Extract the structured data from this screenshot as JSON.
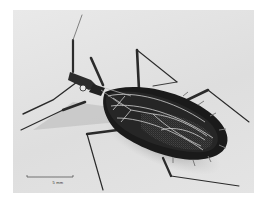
{
  "figure": {
    "scale_bar_label": "5 mm",
    "colors": {
      "background": "#ffffff",
      "plate": "#e4e4e4",
      "body_dark": "#1e1e1e",
      "vein_light": "#cfcfcf",
      "shadow": "#9a9a9a"
    }
  }
}
